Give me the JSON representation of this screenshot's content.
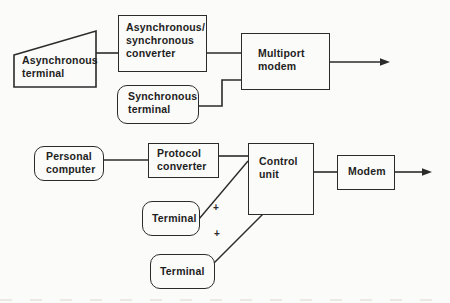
{
  "figure": {
    "colors": {
      "ink": "#2b2b2b",
      "paper": "#fbfbf9"
    },
    "top_row": {
      "async_terminal": {
        "shape": "trapezoid",
        "lines": [
          "Asynchronous",
          "terminal"
        ]
      },
      "async_sync_converter": {
        "shape": "rectangle",
        "lines": [
          "Asynchronous/",
          "synchronous",
          "converter"
        ]
      },
      "sync_terminal": {
        "shape": "rounded-rect",
        "lines": [
          "Synchronous",
          "terminal"
        ]
      },
      "multiport_modem": {
        "shape": "rectangle",
        "lines": [
          "Multiport",
          "modem"
        ]
      }
    },
    "bottom_row": {
      "personal_computer": {
        "shape": "rounded-rect",
        "lines": [
          "Personal",
          "computer"
        ]
      },
      "protocol_converter": {
        "shape": "rectangle",
        "lines": [
          "Protocol",
          "converter"
        ]
      },
      "terminal_1": {
        "shape": "rounded-rect",
        "lines": [
          "Terminal"
        ]
      },
      "terminal_2": {
        "shape": "rounded-rect",
        "lines": [
          "Terminal"
        ]
      },
      "control_unit": {
        "shape": "rectangle",
        "lines": [
          "Control",
          "unit"
        ]
      },
      "modem": {
        "shape": "rectangle",
        "lines": [
          "Modem"
        ]
      }
    },
    "markers": {
      "plus_upper": "+",
      "plus_lower": "+"
    }
  }
}
